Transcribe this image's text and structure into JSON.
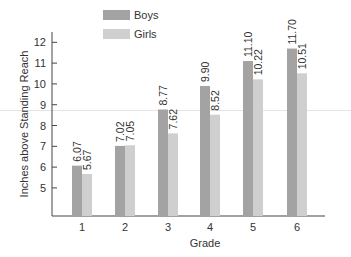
{
  "chart_data": {
    "type": "bar",
    "title": "",
    "xlabel": "Grade",
    "ylabel": "Inches above Standing Reach",
    "categories": [
      "1",
      "2",
      "3",
      "4",
      "5",
      "6"
    ],
    "series": [
      {
        "name": "Boys",
        "color": "#a3a3a3",
        "values": [
          6.07,
          7.02,
          8.77,
          9.9,
          11.1,
          11.7
        ],
        "labels": [
          "6.07",
          "7.02",
          "8.77",
          "9.90",
          "11.10",
          "11.70"
        ]
      },
      {
        "name": "Girls",
        "color": "#cfcfcf",
        "values": [
          5.67,
          7.05,
          7.62,
          8.52,
          10.22,
          10.51
        ],
        "labels": [
          "5.67",
          "7.05",
          "7.62",
          "8.52",
          "10.22",
          "10.51"
        ]
      }
    ],
    "yticks": [
      5,
      6,
      7,
      8,
      9,
      10,
      11,
      12
    ],
    "ylim": [
      3.65,
      12.5
    ],
    "grid": false,
    "legend_position": "top-center",
    "data_labels": "rotated-vertical above bars"
  }
}
